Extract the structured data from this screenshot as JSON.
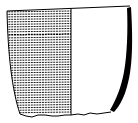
{
  "figure": {
    "left_half": "exterior surface with horizontal hatching",
    "right_half": "cross-section profile with solid black wall",
    "colors": {
      "ink": "#000000",
      "paper": "#ffffff"
    }
  }
}
